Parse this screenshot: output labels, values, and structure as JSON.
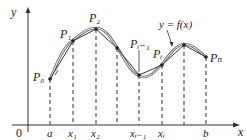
{
  "diagram": {
    "curve_label": "y = f(x)",
    "axes": {
      "x_label": "x",
      "y_label": "y",
      "origin_label": "0"
    },
    "x_ticks": [
      {
        "x": 50,
        "label": "a"
      },
      {
        "x": 73,
        "label": "x₁"
      },
      {
        "x": 96,
        "label": "x₂"
      },
      {
        "x": 117,
        "label": ""
      },
      {
        "x": 140,
        "label": "xᵢ₋₁"
      },
      {
        "x": 162,
        "label": "xᵢ"
      },
      {
        "x": 184,
        "label": ""
      },
      {
        "x": 206,
        "label": "b"
      }
    ],
    "points": [
      {
        "name": "P₀",
        "x": 50,
        "y": 79
      },
      {
        "name": "P₁",
        "x": 73,
        "y": 41
      },
      {
        "name": "P₂",
        "x": 96,
        "y": 29
      },
      {
        "name": "",
        "x": 117,
        "y": 48
      },
      {
        "name": "Pᵢ₋₁",
        "x": 139,
        "y": 75
      },
      {
        "name": "Pᵢ",
        "x": 162,
        "y": 65
      },
      {
        "name": "",
        "x": 184,
        "y": 45
      },
      {
        "name": "Pₙ",
        "x": 206,
        "y": 57
      }
    ],
    "colors": {
      "ink": "#222222",
      "curve": "#555555",
      "dashes": "#333333"
    }
  }
}
